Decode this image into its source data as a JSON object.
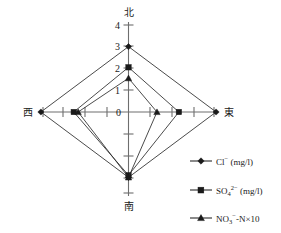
{
  "chart_data": {
    "type": "radar",
    "title": "",
    "categories": [
      "北",
      "東",
      "南",
      "西"
    ],
    "category_meanings": [
      "North",
      "East",
      "South",
      "West"
    ],
    "radial_ticks": [
      "0",
      "1",
      "2",
      "3",
      "4"
    ],
    "rlim": [
      0,
      4
    ],
    "grid": false,
    "legend_position": "bottom-right",
    "series": [
      {
        "name": "Cl⁻ (mg/l)",
        "marker": "diamond",
        "values": [
          3.0,
          4.0,
          3.0,
          4.0
        ]
      },
      {
        "name": "SO₄²⁻ (mg/l)",
        "marker": "square",
        "values": [
          2.05,
          2.3,
          2.9,
          2.5
        ]
      },
      {
        "name": "NO₃⁻-N×10",
        "marker": "triangle",
        "values": [
          1.55,
          1.3,
          3.0,
          2.3
        ]
      }
    ]
  },
  "axes": {
    "north": {
      "label": "北",
      "tick_labels": [
        "1",
        "2",
        "3",
        "4"
      ]
    },
    "east": {
      "label": "東"
    },
    "south": {
      "label": "南"
    },
    "west": {
      "label": "西"
    },
    "origin_label": "0"
  },
  "legend": {
    "items": [
      {
        "label_base": "Cl",
        "label_sup": "−",
        "label_tail": " (mg/l)",
        "marker": "diamond-icon"
      },
      {
        "label_base": "SO",
        "label_sub": "4",
        "label_sup": "2−",
        "label_tail": " (mg/l)",
        "marker": "square-icon"
      },
      {
        "label_base": "NO",
        "label_sub": "3",
        "label_sup": "−",
        "label_tail": "-N×10",
        "marker": "triangle-icon"
      }
    ]
  },
  "colors": {
    "axis": "#6e6e6e",
    "series": "#2b2b2b",
    "text": "#1a1a1a",
    "background": "#ffffff"
  }
}
